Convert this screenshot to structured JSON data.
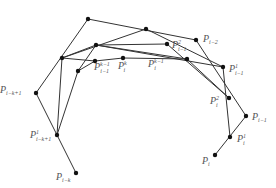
{
  "diagram": {
    "type": "de Boor / control polygon refinement",
    "node_color": "#111111",
    "edge_color": "#333333",
    "label_color": "#555555",
    "nodes": [
      {
        "id": "P_i-k",
        "x": 76,
        "y": 173,
        "label": {
          "base": "P",
          "sub": "i−k",
          "sup": "",
          "x": 56,
          "y": 180
        }
      },
      {
        "id": "P_i-k+1",
        "x": 36,
        "y": 93,
        "label": {
          "base": "P",
          "sub": "i−k+1",
          "sup": "",
          "x": 0,
          "y": 93
        }
      },
      {
        "id": "P_top",
        "x": 88,
        "y": 19,
        "label": null
      },
      {
        "id": "P_i-2",
        "x": 196,
        "y": 40,
        "label": {
          "base": "P",
          "sub": "i−2",
          "sup": "",
          "x": 203,
          "y": 42
        }
      },
      {
        "id": "P_i-1",
        "x": 246,
        "y": 116,
        "label": {
          "base": "P",
          "sub": "i−1",
          "sup": "",
          "x": 252,
          "y": 120
        }
      },
      {
        "id": "P_i",
        "x": 215,
        "y": 155,
        "label": {
          "base": "P",
          "sub": "i",
          "sup": "",
          "x": 202,
          "y": 164
        }
      },
      {
        "id": "P1_i-k+1",
        "x": 57,
        "y": 135,
        "label": {
          "base": "P",
          "sub": "i−k+1",
          "sup": "1",
          "x": 30,
          "y": 138
        }
      },
      {
        "id": "P1_a",
        "x": 62,
        "y": 58,
        "label": null
      },
      {
        "id": "P1_b",
        "x": 146,
        "y": 29,
        "label": null
      },
      {
        "id": "P1_i-1",
        "x": 223,
        "y": 67,
        "label": {
          "base": "P",
          "sub": "i−1",
          "sup": "1",
          "x": 229,
          "y": 72
        }
      },
      {
        "id": "P1_i",
        "x": 230,
        "y": 137,
        "label": {
          "base": "P",
          "sub": "i",
          "sup": "1",
          "x": 237,
          "y": 142
        }
      },
      {
        "id": "P2_a",
        "x": 78,
        "y": 71,
        "label": null
      },
      {
        "id": "P2_b",
        "x": 96,
        "y": 45,
        "label": null
      },
      {
        "id": "P2_i-1",
        "x": 167,
        "y": 44,
        "label": {
          "base": "P",
          "sub": "i−1",
          "sup": "2",
          "x": 172,
          "y": 48
        }
      },
      {
        "id": "P2_i",
        "x": 229,
        "y": 98,
        "label": {
          "base": "P",
          "sub": "i",
          "sup": "2",
          "x": 210,
          "y": 104
        }
      },
      {
        "id": "Pk1_i-1",
        "x": 95,
        "y": 61,
        "label": {
          "base": "P",
          "sub": "i−1",
          "sup": "k−1",
          "x": 94,
          "y": 70
        }
      },
      {
        "id": "Pk_i",
        "x": 123,
        "y": 58,
        "label": {
          "base": "P",
          "sub": "i",
          "sup": "k",
          "x": 118,
          "y": 69
        }
      },
      {
        "id": "Pk1_i",
        "x": 187,
        "y": 59,
        "label": {
          "base": "P",
          "sub": "i",
          "sup": "k−1",
          "x": 148,
          "y": 67
        }
      }
    ],
    "polylines": [
      {
        "name": "control-polygon",
        "points": [
          "P_i-k",
          "P_i-k+1",
          "P_top",
          "P_i-2",
          "P_i-1",
          "P_i"
        ]
      },
      {
        "name": "level-1-polygon",
        "points": [
          "P1_i-k+1",
          "P1_a",
          "P1_b",
          "P1_i-1",
          "P1_i"
        ]
      },
      {
        "name": "level-2-polygon",
        "points": [
          "P1_i-k+1",
          "P2_a",
          "P2_b",
          "P2_i-1",
          "P2_i"
        ]
      },
      {
        "name": "level-k-1-polygon",
        "points": [
          "P2_a",
          "Pk1_i-1",
          "Pk_i",
          "Pk1_i"
        ]
      },
      {
        "name": "level-1-inner",
        "points": [
          "P1_a",
          "P2_b",
          "P1_i-1"
        ]
      },
      {
        "name": "level-2-inner",
        "points": [
          "P2_b",
          "Pk1_i",
          "P2_i"
        ]
      },
      {
        "name": "level-k-inner",
        "points": [
          "P1_a",
          "Pk1_i-1"
        ]
      }
    ]
  }
}
